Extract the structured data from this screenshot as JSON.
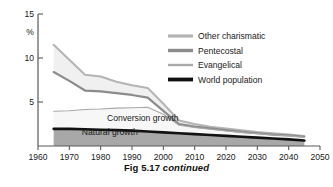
{
  "caption": {
    "main": "Fig 5.17",
    "continued": "continued"
  },
  "chart_data": {
    "type": "area",
    "title": "",
    "subtitle": "",
    "xlabel": "",
    "ylabel": "%",
    "xlim": [
      1960,
      2050
    ],
    "ylim": [
      0,
      15
    ],
    "xticks": [
      1960,
      1970,
      1980,
      1990,
      2000,
      2010,
      2020,
      2030,
      2040,
      2050
    ],
    "xtick_labels": [
      "1960",
      "1970",
      "1980",
      "1990",
      "2000",
      "2010",
      "2020",
      "2030",
      "2040",
      "2050"
    ],
    "yticks": [
      5,
      10,
      15
    ],
    "ytick_labels": [
      "5",
      "10",
      "15"
    ],
    "grid": false,
    "legend_position": "upper-right",
    "stacked": true,
    "x": [
      1965,
      1970,
      1975,
      1980,
      1985,
      1990,
      1995,
      2000,
      2005,
      2010,
      2015,
      2020,
      2025,
      2030,
      2035,
      2040,
      2045
    ],
    "series": [
      {
        "name": "Other charismatic",
        "color": "#b4b4b4",
        "linewidth": 2.0,
        "fill": "#f0f0f0",
        "values": [
          11.5,
          9.8,
          8.1,
          7.9,
          7.3,
          6.9,
          6.6,
          4.8,
          2.9,
          2.5,
          2.2,
          2.0,
          1.8,
          1.6,
          1.45,
          1.3,
          1.15
        ]
      },
      {
        "name": "Pentecostal",
        "color": "#8c8c8c",
        "linewidth": 2.2,
        "fill": "#ffffff",
        "values": [
          8.4,
          7.4,
          6.3,
          6.2,
          6.0,
          5.8,
          5.5,
          4.0,
          2.5,
          2.2,
          2.0,
          1.8,
          1.6,
          1.45,
          1.3,
          1.2,
          1.05
        ]
      },
      {
        "name": "Evangelical",
        "color": "#a8a8a8",
        "linewidth": 1.1,
        "fill": "#f7f7f7",
        "values": [
          3.95,
          4.0,
          4.15,
          4.2,
          4.3,
          4.35,
          4.4,
          3.6,
          2.35,
          2.1,
          1.9,
          1.7,
          1.55,
          1.4,
          1.25,
          1.15,
          1.0
        ]
      },
      {
        "name": "World population",
        "color": "#111111",
        "linewidth": 2.6,
        "fill": "#a8a8a8",
        "values": [
          1.95,
          1.95,
          1.9,
          1.85,
          1.8,
          1.75,
          1.65,
          1.55,
          1.45,
          1.35,
          1.25,
          1.15,
          1.05,
          0.95,
          0.85,
          0.75,
          0.62
        ]
      }
    ],
    "annotations": [
      {
        "name": "conversion-growth",
        "text": "Conversion growth",
        "x": 1982,
        "y": 2.85
      },
      {
        "name": "natural-growth",
        "text": "Natural growth",
        "x": 1974,
        "y": 1.2
      }
    ]
  }
}
